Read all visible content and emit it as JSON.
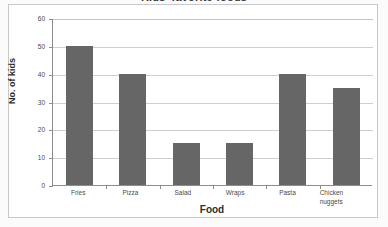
{
  "chart_data": {
    "type": "bar",
    "title": "Kids' favorite foods",
    "xlabel": "Food",
    "ylabel": "No. of kids",
    "categories": [
      "Fries",
      "Pizza",
      "Salad",
      "Wraps",
      "Pasta",
      "Chicken nuggets"
    ],
    "category_lines": [
      [
        "Fries"
      ],
      [
        "Pizza"
      ],
      [
        "Salad"
      ],
      [
        "Wraps"
      ],
      [
        "Pasta"
      ],
      [
        "Chicken",
        "nuggets"
      ]
    ],
    "values": [
      50,
      40,
      15,
      15,
      40,
      35
    ],
    "ylim": [
      0,
      60
    ],
    "yticks": [
      0,
      10,
      20,
      30,
      40,
      50,
      60
    ],
    "ytick_labels": [
      "0",
      "10",
      "20",
      "30",
      "40",
      "50",
      "60"
    ],
    "grid": true,
    "legend": false,
    "bar_color": "#666666",
    "gridline_color": "#cfcfcf",
    "axis_color": "#8d8d8d"
  }
}
